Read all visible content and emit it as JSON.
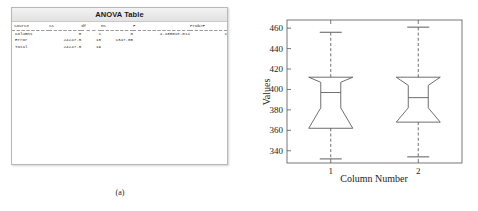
{
  "panel_a": {
    "caption": "(a)",
    "window": {
      "title": "ANOVA Table",
      "table": {
        "headers": [
          "Source",
          "SS",
          "df",
          "MS",
          "F",
          "Prob>F"
        ],
        "rows": [
          {
            "source": "Columns",
            "ss": "0",
            "df": "1",
            "ms": "0",
            "f": "4.18801e-011",
            "p": "1"
          },
          {
            "source": "Error",
            "ss": "24247.5",
            "df": "18",
            "ms": "1347.08",
            "f": "",
            "p": ""
          },
          {
            "source": "Total",
            "ss": "24247.5",
            "df": "19",
            "ms": "",
            "f": "",
            "p": ""
          }
        ]
      }
    }
  },
  "panel_b": {
    "caption": "(b)"
  },
  "chart_data": {
    "type": "boxplot",
    "title": "",
    "xlabel": "Column Number",
    "ylabel": "Values",
    "categories": [
      "1",
      "2"
    ],
    "x_ticks": [
      "1",
      "2"
    ],
    "y_ticks": [
      340,
      360,
      380,
      400,
      420,
      440,
      460
    ],
    "ylim": [
      328,
      468
    ],
    "grid": false,
    "legend": null,
    "notched": true,
    "series": [
      {
        "name": "1",
        "x": 1,
        "whisker_low": 332,
        "q1": 362,
        "median": 397,
        "q3": 412,
        "whisker_high": 456,
        "notch_low": 382,
        "notch_high": 407,
        "notch_inset": 0.55
      },
      {
        "name": "2",
        "x": 2,
        "whisker_low": 334,
        "q1": 368,
        "median": 392,
        "q3": 412,
        "whisker_high": 461,
        "notch_low": 382,
        "notch_high": 404,
        "notch_inset": 0.55
      }
    ]
  }
}
